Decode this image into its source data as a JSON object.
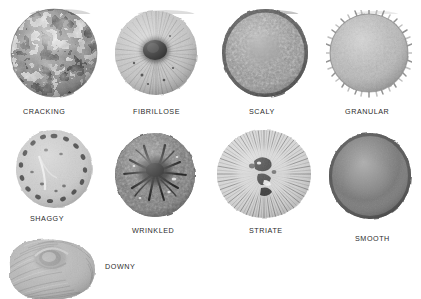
{
  "plate": {
    "title_visible": false,
    "background_color": "#ffffff",
    "label_color": "#2b2b2b",
    "columns": 4,
    "rows": 3
  },
  "specimens": [
    {
      "label": "CRACKING",
      "icon": "cracking-cap-icon",
      "row": 1,
      "col": 1,
      "img_x": 8,
      "img_y": 6,
      "img_w": 93,
      "img_h": 96,
      "label_x": 23,
      "label_y": 107,
      "base_color": "#9d9d9d",
      "pattern": "reticulate cracked network, dark fissures over pale plates",
      "edge": "irregular round",
      "center_tone": "#8c8c8c"
    },
    {
      "label": "FIBRILLOSE",
      "icon": "fibrillose-cap-icon",
      "row": 1,
      "col": 2,
      "img_x": 112,
      "img_y": 8,
      "img_w": 88,
      "img_h": 92,
      "label_x": 133,
      "label_y": 107,
      "base_color": "#bcbcbc",
      "pattern": "radiating fine fibrils from a very dark umbo",
      "edge": "fringed round",
      "center_tone": "#1f1f1f"
    },
    {
      "label": "SCALY",
      "icon": "scaly-cap-icon",
      "row": 1,
      "col": 3,
      "img_x": 219,
      "img_y": 6,
      "img_w": 92,
      "img_h": 96,
      "label_x": 249,
      "label_y": 107,
      "base_color": "#7a7a7a",
      "pattern": "dense overlapping small scales, darker margin",
      "edge": "irregular round",
      "center_tone": "#6e6e6e"
    },
    {
      "label": "GRANULAR",
      "icon": "granular-cap-icon",
      "row": 1,
      "col": 4,
      "img_x": 326,
      "img_y": 10,
      "img_w": 86,
      "img_h": 88,
      "label_x": 345,
      "label_y": 107,
      "base_color": "#b2b2b2",
      "pattern": "even granular surface with spiky warted margin",
      "edge": "spiny round",
      "center_tone": "#ababab"
    },
    {
      "label": "SHAGGY",
      "icon": "shaggy-cap-icon",
      "row": 2,
      "col": 1,
      "img_x": 12,
      "img_y": 128,
      "img_w": 84,
      "img_h": 82,
      "label_x": 30,
      "label_y": 214,
      "base_color": "#c2c2c2",
      "pattern": "pale disc with coarse dark shaggy flecks in a marginal ring",
      "edge": "rough round",
      "center_tone": "#bdbdbd"
    },
    {
      "label": "WRINKLED",
      "icon": "wrinkled-cap-icon",
      "row": 2,
      "col": 2,
      "img_x": 112,
      "img_y": 130,
      "img_w": 86,
      "img_h": 90,
      "label_x": 132,
      "label_y": 226,
      "base_color": "#6a6a6a",
      "pattern": "dark veined wrinkles radiating from a near-black centre",
      "edge": "lobed round",
      "center_tone": "#171717"
    },
    {
      "label": "STRIATE",
      "icon": "striate-cap-icon",
      "row": 2,
      "col": 3,
      "img_x": 214,
      "img_y": 128,
      "img_w": 100,
      "img_h": 92,
      "label_x": 249,
      "label_y": 226,
      "base_color": "#cfcfcf",
      "pattern": "strong radial striations to the margin, dark central blotch",
      "edge": "striate round",
      "center_tone": "#7c7c7c"
    },
    {
      "label": "SMOOTH",
      "icon": "smooth-cap-icon",
      "row": 2,
      "col": 4,
      "img_x": 326,
      "img_y": 130,
      "img_w": 88,
      "img_h": 92,
      "label_x": 355,
      "label_y": 234,
      "base_color": "#6f6f6f",
      "pattern": "even featureless matte surface",
      "edge": "smooth round",
      "center_tone": "#787878"
    },
    {
      "label": "DOWNY",
      "icon": "downy-cap-icon",
      "row": 3,
      "col": 1,
      "img_x": 2,
      "img_y": 236,
      "img_w": 98,
      "img_h": 63,
      "label_x": 105,
      "label_y": 262,
      "base_color": "#b0b0b0",
      "pattern": "inrolled felted cap with fine downy radial nap, cropped at bottom",
      "edge": "inrolled",
      "center_tone": "#9a9a9a"
    }
  ]
}
